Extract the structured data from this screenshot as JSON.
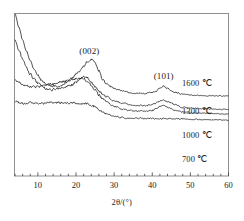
{
  "chart_data": {
    "type": "line",
    "title": "",
    "subtitle": "",
    "xlabel": "2θ/(°)",
    "ylabel": "",
    "xlim": [
      4,
      60
    ],
    "ylim": [
      0,
      100
    ],
    "grid": false,
    "legend_position": "inline-right",
    "xticks": [
      10,
      20,
      30,
      40,
      50,
      60
    ],
    "xtick_labels": [
      "10",
      "20",
      "30",
      "40",
      "50",
      "60"
    ],
    "minor_tick_step": 2,
    "yticks": [],
    "ytick_labels": [],
    "annotations": [
      {
        "text": "(002)",
        "x": 23.5,
        "y": 88,
        "note": "graphite 002 reflection"
      },
      {
        "text": "(101)",
        "x": 43.0,
        "y": 72,
        "note": "graphite 101 reflection"
      }
    ],
    "series": [
      {
        "name": "1600 ℃",
        "label": "1600 ℃",
        "color": "#141414",
        "offset_note": "topmost curve",
        "x": [
          4,
          5,
          6,
          7,
          8,
          9,
          10,
          11,
          12,
          13,
          14,
          15,
          16,
          17,
          18,
          19,
          20,
          21,
          22,
          23,
          24,
          25,
          26,
          27,
          28,
          30,
          32,
          34,
          36,
          38,
          40,
          41,
          42,
          43,
          44,
          45,
          46,
          48,
          50,
          52,
          54,
          56,
          58,
          60
        ],
        "y": [
          100,
          92,
          84,
          77,
          71,
          66,
          62,
          59,
          57,
          56,
          55.5,
          55.5,
          56,
          57,
          58.5,
          60.5,
          63,
          65,
          67.5,
          70.5,
          72,
          70,
          65,
          60,
          57,
          54,
          52.5,
          51.5,
          51,
          51,
          51.5,
          52.5,
          54.5,
          55.5,
          54,
          52.5,
          51.5,
          50.5,
          50,
          49.8,
          49.6,
          49.5,
          49.4,
          49.3
        ]
      },
      {
        "name": "1300 ℃",
        "label": "1300 ℃",
        "color": "#141414",
        "offset_note": "second curve",
        "x": [
          4,
          5,
          6,
          7,
          8,
          9,
          10,
          11,
          12,
          13,
          14,
          15,
          16,
          17,
          18,
          19,
          20,
          21,
          22,
          23,
          24,
          25,
          26,
          27,
          28,
          30,
          32,
          34,
          36,
          38,
          40,
          41,
          42,
          43,
          44,
          45,
          46,
          48,
          50,
          52,
          54,
          56,
          58,
          60
        ],
        "y": [
          84,
          78,
          72,
          67,
          63,
          60,
          57.5,
          55.5,
          54,
          53.5,
          53.5,
          54,
          54.5,
          55,
          55.5,
          56.5,
          58,
          60,
          61.5,
          60.5,
          58,
          55,
          52.5,
          50.5,
          49,
          46.5,
          45,
          44,
          43.5,
          43.5,
          44,
          45,
          46.5,
          47,
          46,
          45,
          44,
          42.5,
          42,
          41.7,
          41.5,
          41.3,
          41.2,
          41
        ]
      },
      {
        "name": "1000 ℃",
        "label": "1000 ℃",
        "color": "#141414",
        "offset_note": "third curve",
        "x": [
          4,
          5,
          6,
          7,
          8,
          9,
          10,
          11,
          12,
          13,
          14,
          15,
          16,
          17,
          18,
          19,
          20,
          21,
          22,
          23,
          24,
          25,
          26,
          27,
          28,
          30,
          32,
          34,
          36,
          38,
          40,
          41,
          42,
          43,
          44,
          45,
          46,
          48,
          50,
          52,
          54,
          56,
          58,
          60
        ],
        "y": [
          60,
          58,
          56.5,
          55.5,
          55,
          55,
          55,
          55.5,
          56,
          56.5,
          57,
          57.5,
          58,
          58.5,
          59,
          59.5,
          60,
          60.5,
          60,
          58.5,
          56,
          53,
          50,
          47.5,
          45.5,
          43,
          41.5,
          40.5,
          40,
          40,
          40.5,
          41.5,
          43,
          43.5,
          42.5,
          41.5,
          40.5,
          39.5,
          39,
          38.8,
          38.6,
          38.5,
          38.4,
          38.3
        ]
      },
      {
        "name": "700 ℃",
        "label": "700 ℃",
        "color": "#141414",
        "offset_note": "bottom curve",
        "x": [
          4,
          5,
          6,
          7,
          8,
          9,
          10,
          11,
          12,
          13,
          14,
          15,
          16,
          17,
          18,
          19,
          20,
          21,
          22,
          23,
          24,
          25,
          26,
          27,
          28,
          30,
          32,
          34,
          36,
          38,
          40,
          42,
          44,
          46,
          48,
          50,
          52,
          54,
          56,
          58,
          60
        ],
        "y": [
          46,
          45.5,
          45,
          45,
          45,
          45,
          45,
          45,
          45,
          45.2,
          45.3,
          45.3,
          45.2,
          45,
          45,
          45,
          45,
          45,
          44.8,
          44.5,
          43.8,
          42.5,
          41,
          39.5,
          38.5,
          37,
          36.2,
          35.8,
          35.6,
          35.5,
          35.5,
          35.5,
          35.4,
          35.3,
          35.2,
          35,
          34.9,
          34.8,
          34.7,
          34.6,
          34.5
        ]
      }
    ]
  },
  "frame": {
    "border_color": "#8a8a8a",
    "axis_color": "#3a3a3a"
  }
}
